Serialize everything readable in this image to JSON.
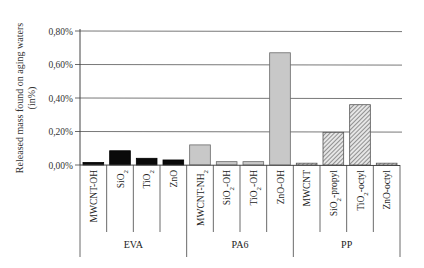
{
  "chart_data": {
    "type": "bar",
    "title": "",
    "xlabel": "",
    "ylabel": "Released mass found on aging waters (in%)",
    "ylabel_lines": [
      "Released mass found on aging waters",
      "(in%)"
    ],
    "ylim": [
      0,
      0.8
    ],
    "yticks": [
      "0,00%",
      "0,20%",
      "0,40%",
      "0,60%",
      "0,80%"
    ],
    "ytick_values": [
      0,
      0.2,
      0.4,
      0.6,
      0.8
    ],
    "grid": true,
    "legend": null,
    "groups": [
      {
        "name": "EVA",
        "style": "black",
        "categories": [
          "MWCNT-OH",
          "SiO2",
          "TiO2",
          "ZnO"
        ],
        "values": [
          0.015,
          0.085,
          0.04,
          0.03
        ]
      },
      {
        "name": "PA6",
        "style": "gray",
        "categories": [
          "MWCNT-NH2",
          "SiO2-OH",
          "TiO2-OH",
          "ZnO-OH"
        ],
        "values": [
          0.12,
          0.02,
          0.02,
          0.67
        ]
      },
      {
        "name": "PP",
        "style": "hatched",
        "categories": [
          "MWCNT",
          "SiO2-propyl",
          "TiO2-octyl",
          "ZnO-octyl"
        ],
        "values": [
          0.005,
          0.195,
          0.36,
          0.005
        ]
      }
    ],
    "categories": [
      "MWCNT-OH",
      "SiO2",
      "TiO2",
      "ZnO",
      "MWCNT-NH2",
      "SiO2-OH",
      "TiO2-OH",
      "ZnO-OH",
      "MWCNT",
      "SiO2-propyl",
      "TiO2-octyl",
      "ZnO-octyl"
    ],
    "values": [
      0.015,
      0.085,
      0.04,
      0.03,
      0.12,
      0.02,
      0.02,
      0.67,
      0.005,
      0.195,
      0.36,
      0.005
    ],
    "units": "%"
  },
  "colors": {
    "black": "#0a0a0a",
    "gray": "#c8c8c8",
    "hatch_bg": "#e8e8e8",
    "hatch_line": "#555555",
    "grid": "#555555",
    "axis": "#444444"
  }
}
